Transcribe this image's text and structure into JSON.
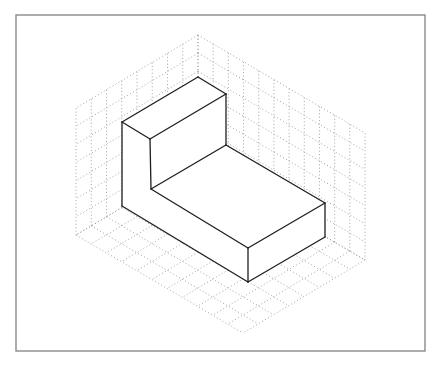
{
  "diagram": {
    "type": "isometric-drawing",
    "colors": {
      "background": "#ffffff",
      "frame": "#8a8a8a",
      "grid": "#9a9a9a",
      "solid_edges": "#1e1e1e"
    },
    "frame": {
      "x": 16,
      "y": 15,
      "width": 409,
      "height": 336
    },
    "grid": {
      "origin": [
        198,
        162
      ],
      "left_axis": [
        -122,
        73
      ],
      "right_axis": [
        167,
        98
      ],
      "up_axis": [
        0,
        -127
      ],
      "left_divisions": 8,
      "right_divisions": 11,
      "up_divisions": 7
    },
    "solid": {
      "edges": [
        [
          [
            122,
            122
          ],
          [
            198,
            77
          ]
        ],
        [
          [
            198,
            77
          ],
          [
            226,
            94
          ]
        ],
        [
          [
            226,
            94
          ],
          [
            150,
            139
          ]
        ],
        [
          [
            150,
            139
          ],
          [
            122,
            122
          ]
        ],
        [
          [
            122,
            122
          ],
          [
            122,
            206
          ]
        ],
        [
          [
            150,
            139
          ],
          [
            151,
            189
          ]
        ],
        [
          [
            226,
            94
          ],
          [
            226,
            145
          ]
        ],
        [
          [
            151,
            189
          ],
          [
            226,
            145
          ]
        ],
        [
          [
            151,
            189
          ],
          [
            248,
            248
          ]
        ],
        [
          [
            226,
            145
          ],
          [
            325,
            203
          ]
        ],
        [
          [
            248,
            248
          ],
          [
            325,
            203
          ]
        ],
        [
          [
            248,
            248
          ],
          [
            248,
            282
          ]
        ],
        [
          [
            325,
            203
          ],
          [
            325,
            237
          ]
        ],
        [
          [
            122,
            206
          ],
          [
            248,
            282
          ]
        ],
        [
          [
            248,
            282
          ],
          [
            325,
            237
          ]
        ]
      ]
    }
  }
}
